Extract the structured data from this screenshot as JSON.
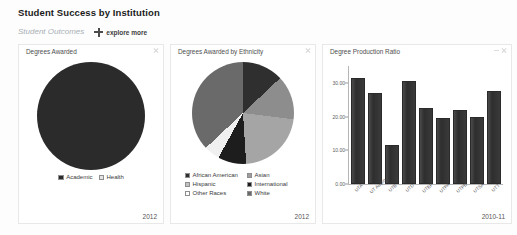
{
  "header": {
    "title": "Student Success by Institution",
    "subtitle": "Student Outcomes",
    "explore_label": "explore more",
    "plus_icon": "plus-icon"
  },
  "panels": [
    {
      "title": "Degrees Awarded",
      "year": "2012",
      "close_icon": "close-icon",
      "minimize_icon": "minimize-icon"
    },
    {
      "title": "Degrees Awarded by Ethnicity",
      "year": "2012",
      "close_icon": "close-icon",
      "minimize_icon": "minimize-icon"
    },
    {
      "title": "Degree Production Ratio",
      "year": "2010-11",
      "close_icon": "close-icon",
      "minimize_icon": "minimize-icon"
    }
  ],
  "chart_data": [
    {
      "type": "pie",
      "title": "Degrees Awarded",
      "labels": [
        "Academic",
        "Health"
      ],
      "values": [
        88,
        12
      ],
      "colors": [
        "#2b2b2b",
        "#b9b9b9"
      ],
      "legend_position": "bottom",
      "period": "2012"
    },
    {
      "type": "pie",
      "title": "Degrees Awarded by Ethnicity",
      "labels": [
        "African American",
        "Asian",
        "Hispanic",
        "International",
        "Other Races",
        "White"
      ],
      "values": [
        8,
        14,
        22,
        9,
        5,
        42
      ],
      "colors": [
        "#2f2f2f",
        "#8d8d8d",
        "#a5a5a5",
        "#1d1d1d",
        "#f0f0f0",
        "#6a6a6a"
      ],
      "legend_position": "bottom",
      "period": "2012"
    },
    {
      "type": "bar",
      "title": "Degree Production Ratio",
      "categories": [
        "UTA",
        "UT Austin",
        "UTB",
        "UTD",
        "UTEP",
        "UTPA",
        "UTPB",
        "UTSA",
        "UTT"
      ],
      "values": [
        31.5,
        27.0,
        11.5,
        30.5,
        22.5,
        19.5,
        22.0,
        20.0,
        27.5
      ],
      "ytick_labels": [
        "30.00",
        "20.00",
        "10.00",
        "0.00"
      ],
      "ytick_values": [
        30,
        20,
        10,
        0
      ],
      "ylim": [
        0,
        35
      ],
      "xlabel": "",
      "ylabel": "",
      "grid": false,
      "bar_color": "#333333",
      "period": "2010-11"
    }
  ]
}
